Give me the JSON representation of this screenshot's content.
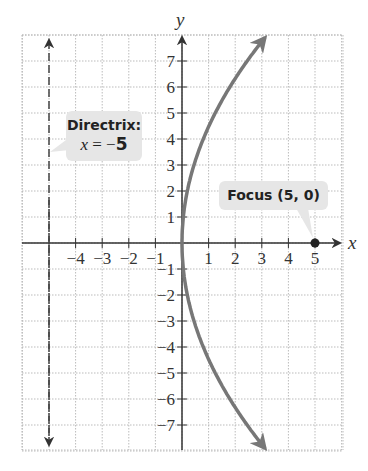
{
  "chart_data": {
    "type": "line",
    "title": "",
    "xlabel": "x",
    "ylabel": "y",
    "xlim": [
      -6,
      6
    ],
    "ylim": [
      -8,
      8
    ],
    "grid": true,
    "x_ticks": [
      -4,
      -3,
      -2,
      -1,
      1,
      2,
      3,
      4,
      5
    ],
    "y_ticks": [
      -7,
      -6,
      -5,
      -4,
      -3,
      -2,
      -1,
      1,
      2,
      3,
      4,
      5,
      6,
      7
    ],
    "series": [
      {
        "name": "parabola",
        "equation": "y^2 = 20x",
        "color": "#777777",
        "points": [
          [
            3.1,
            7.9
          ],
          [
            2.45,
            7
          ],
          [
            1.8,
            6
          ],
          [
            1.25,
            5
          ],
          [
            0.8,
            4
          ],
          [
            0.45,
            3
          ],
          [
            0.2,
            2
          ],
          [
            0.05,
            1
          ],
          [
            0,
            0
          ],
          [
            0.05,
            -1
          ],
          [
            0.2,
            -2
          ],
          [
            0.45,
            -3
          ],
          [
            0.8,
            -4
          ],
          [
            1.25,
            -5
          ],
          [
            1.8,
            -6
          ],
          [
            2.45,
            -7
          ],
          [
            3.1,
            -7.9
          ]
        ]
      },
      {
        "name": "directrix",
        "equation": "x = -5",
        "style": "dashed",
        "color": "#444444"
      }
    ],
    "points": [
      {
        "name": "focus",
        "x": 5,
        "y": 0
      }
    ],
    "annotations": [
      {
        "text": "Directrix:",
        "subtext": "x = −5"
      },
      {
        "text": "Focus (5, 0)"
      }
    ]
  },
  "labels": {
    "directrix_title": "Directrix:",
    "directrix_var": "x",
    "directrix_eq": " = −",
    "directrix_val": "5",
    "focus": "Focus (5, 0)",
    "x_axis": "x",
    "y_axis": "y"
  }
}
